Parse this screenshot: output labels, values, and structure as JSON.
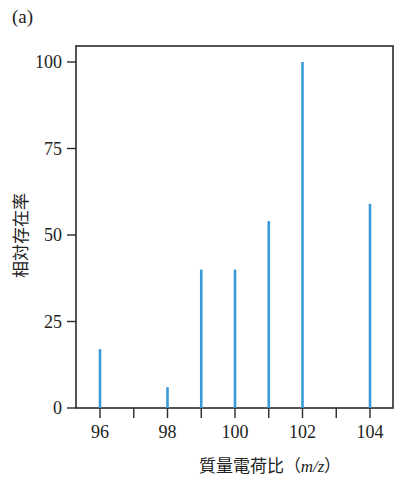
{
  "panel_label": "(a)",
  "chart_data": {
    "type": "bar",
    "title": "",
    "xlabel": "質量電荷比（m/z）",
    "ylabel": "相対存在率",
    "x": [
      96,
      98,
      99,
      100,
      101,
      102,
      104
    ],
    "values": [
      17,
      6,
      40,
      40,
      54,
      100,
      59
    ],
    "xlim": [
      95.3,
      104.7
    ],
    "ylim": [
      0,
      104
    ],
    "x_ticks": [
      96,
      97,
      98,
      99,
      100,
      101,
      102,
      103,
      104
    ],
    "x_tick_labels": [
      "96",
      "98",
      "100",
      "102",
      "104"
    ],
    "y_ticks": [
      0,
      25,
      50,
      75,
      100
    ],
    "y_tick_labels": [
      "0",
      "25",
      "50",
      "75",
      "100"
    ],
    "grid": false,
    "legend": null,
    "bar_color": "#3a9ad9"
  },
  "axis_labels": {
    "x_prefix": "質量電荷比（",
    "x_italic": "m/z",
    "x_suffix": "）",
    "y": "相対存在率"
  }
}
